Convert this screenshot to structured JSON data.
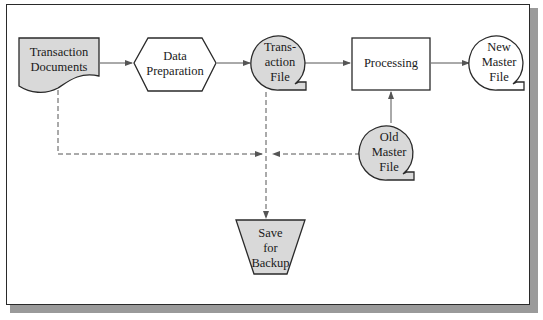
{
  "diagram": {
    "type": "flowchart",
    "nodes": {
      "transaction_documents": {
        "label": "Transaction Documents",
        "line1": "Transaction",
        "line2": "Documents",
        "shape": "document",
        "fill": "#d9d9d9"
      },
      "data_preparation": {
        "label": "Data Preparation",
        "line1": "Data",
        "line2": "Preparation",
        "shape": "hexagon",
        "fill": "#ffffff"
      },
      "transaction_file": {
        "label": "Transaction File",
        "line1": "Trans-",
        "line2": "action",
        "line3": "File",
        "shape": "magnetic-tape",
        "fill": "#d9d9d9"
      },
      "processing": {
        "label": "Processing",
        "shape": "rectangle",
        "fill": "#ffffff"
      },
      "new_master_file": {
        "label": "New Master File",
        "line1": "New",
        "line2": "Master",
        "line3": "File",
        "shape": "magnetic-tape",
        "fill": "#ffffff"
      },
      "old_master_file": {
        "label": "Old Master File",
        "line1": "Old",
        "line2": "Master",
        "line3": "File",
        "shape": "magnetic-tape",
        "fill": "#d9d9d9"
      },
      "save_for_backup": {
        "label": "Save for Backup",
        "line1": "Save",
        "line2": "for",
        "line3": "Backup",
        "shape": "offline-storage",
        "fill": "#d9d9d9"
      }
    },
    "edges": [
      {
        "from": "Transaction Documents",
        "to": "Data Preparation",
        "style": "solid"
      },
      {
        "from": "Data Preparation",
        "to": "Transaction File",
        "style": "solid"
      },
      {
        "from": "Transaction File",
        "to": "Processing",
        "style": "solid"
      },
      {
        "from": "Processing",
        "to": "New Master File",
        "style": "solid"
      },
      {
        "from": "Old Master File",
        "to": "Processing",
        "style": "solid"
      },
      {
        "from": "Transaction Documents",
        "to": "Save for Backup",
        "style": "dashed"
      },
      {
        "from": "Transaction File",
        "to": "Save for Backup",
        "style": "dashed"
      },
      {
        "from": "Old Master File",
        "to": "Save for Backup",
        "style": "dashed"
      }
    ],
    "colors": {
      "stroke": "#2a2a2a",
      "shaded_fill": "#d9d9d9",
      "arrow": "#555555",
      "shadow": "#9a9a9a"
    }
  }
}
